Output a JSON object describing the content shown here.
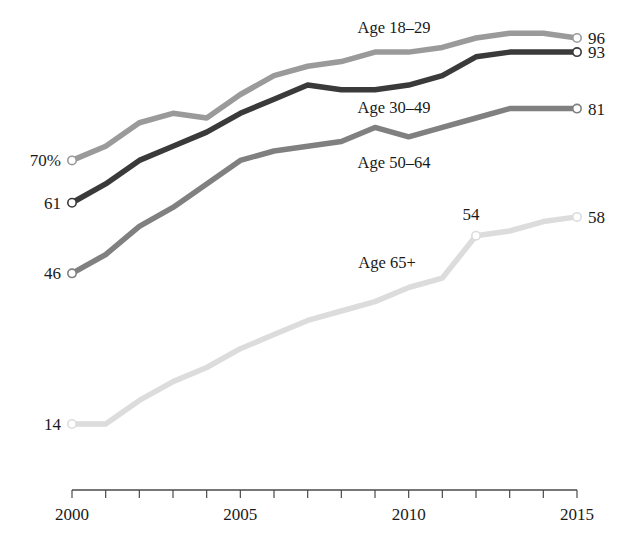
{
  "chart_data": {
    "type": "line",
    "title": "",
    "subtitle": "",
    "xlabel": "",
    "ylabel": "",
    "xlim": [
      2000,
      2015
    ],
    "ylim": [
      0,
      100
    ],
    "grid": false,
    "legend_position": "inline-annotations",
    "x": [
      2000,
      2001,
      2002,
      2003,
      2004,
      2005,
      2006,
      2007,
      2008,
      2009,
      2010,
      2011,
      2012,
      2013,
      2014,
      2015
    ],
    "x_tick_labels": [
      {
        "value": 2000,
        "label": "2000"
      },
      {
        "value": 2005,
        "label": "2005"
      },
      {
        "value": 2010,
        "label": "2010"
      },
      {
        "value": 2015,
        "label": "2015"
      }
    ],
    "series": [
      {
        "name": "Age 18-29",
        "label": "Age 18–29",
        "color": "#9a9a9a",
        "values": [
          70,
          73,
          78,
          80,
          79,
          84,
          88,
          90,
          91,
          93,
          93,
          94,
          96,
          97,
          97,
          96
        ],
        "start_label": "70%",
        "end_label": "96",
        "annotation": {
          "text": "Age 18–29",
          "x": 394,
          "y": 33
        },
        "start_value": 70,
        "end_value": 96
      },
      {
        "name": "Age 30-49",
        "label": "Age 30–49",
        "color": "#3a3a3a",
        "values": [
          61,
          65,
          70,
          73,
          76,
          80,
          83,
          86,
          85,
          85,
          86,
          88,
          92,
          93,
          93,
          93
        ],
        "start_label": "61",
        "end_label": "93",
        "annotation": {
          "text": "Age 30–49",
          "x": 394,
          "y": 113
        },
        "start_value": 61,
        "end_value": 93
      },
      {
        "name": "Age 50-64",
        "label": "Age 50–64",
        "color": "#808080",
        "values": [
          46,
          50,
          56,
          60,
          65,
          70,
          72,
          73,
          74,
          77,
          75,
          77,
          79,
          81,
          81,
          81
        ],
        "start_label": "46",
        "end_label": "81",
        "annotation": {
          "text": "Age 50–64",
          "x": 394,
          "y": 168
        },
        "start_value": 46,
        "end_value": 81
      },
      {
        "name": "Age 65+",
        "label": "Age 65+",
        "color": "#dcdcdc",
        "values": [
          14,
          14,
          19,
          23,
          26,
          30,
          33,
          36,
          38,
          40,
          43,
          45,
          54,
          55,
          57,
          58
        ],
        "start_label": "14",
        "end_label": "58",
        "annotation": {
          "text": "Age 65+",
          "x": 387,
          "y": 268
        },
        "start_value": 14,
        "end_value": 58,
        "extra_point_labels": [
          {
            "text": "54",
            "x": 2012,
            "value": 54,
            "dx": -5,
            "dy": -16
          }
        ]
      }
    ]
  },
  "axis": {
    "x_start_label": "2000",
    "x_mid1_label": "2005",
    "x_mid2_label": "2010",
    "x_end_label": "2015"
  }
}
